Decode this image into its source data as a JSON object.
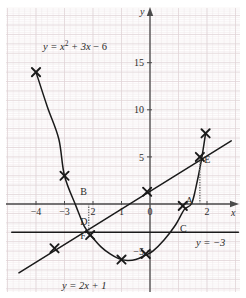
{
  "chart_data": {
    "type": "line",
    "title": "",
    "xlabel": "x",
    "ylabel": "y",
    "xlim": [
      -4.85,
      3.1
    ],
    "ylim": [
      -7.6,
      16.8
    ],
    "grid": true,
    "grid_major": 1,
    "grid_minor": 0.2,
    "x_ticks": [
      -4,
      -3,
      -2,
      -1,
      0,
      2
    ],
    "x_tick_labels": [
      "−4",
      "−3",
      "2",
      "1",
      "0",
      "2"
    ],
    "y_ticks": [
      15,
      10,
      5,
      -5
    ],
    "y_tick_labels": [
      "15",
      "10",
      "5",
      "−5"
    ],
    "series": [
      {
        "name": "parabola",
        "label": "y = x² + 3x − 6",
        "type": "curve",
        "points": [
          [
            -4.0,
            14.0
          ],
          [
            -3.6,
            10.3
          ],
          [
            -3.2,
            6.9
          ],
          [
            -3.0,
            3.0
          ],
          [
            -2.6,
            -0.2
          ],
          [
            -2.3,
            -2.4
          ],
          [
            -2.0,
            -3.6
          ],
          [
            -1.7,
            -4.6
          ],
          [
            -1.4,
            -5.3
          ],
          [
            -1.1,
            -5.8
          ],
          [
            -0.8,
            -6.0
          ],
          [
            -0.5,
            -5.9
          ],
          [
            -0.2,
            -5.5
          ],
          [
            0.1,
            -5.0
          ],
          [
            0.5,
            -3.8
          ],
          [
            0.9,
            -2.2
          ],
          [
            1.2,
            -0.6
          ],
          [
            1.45,
            0.0
          ],
          [
            1.6,
            1.6
          ],
          [
            1.8,
            4.6
          ],
          [
            1.95,
            7.5
          ]
        ],
        "markers": [
          [
            -4.0,
            14.0
          ],
          [
            -3.0,
            3.0
          ],
          [
            -2.1,
            -3.3
          ],
          [
            -1.0,
            -5.9
          ],
          [
            -0.15,
            -5.3
          ],
          [
            1.15,
            -0.2
          ],
          [
            1.95,
            7.5
          ]
        ]
      },
      {
        "name": "line",
        "label": "y = 2x + 1",
        "type": "straight",
        "points": [
          [
            -4.6,
            -7.3
          ],
          [
            2.85,
            6.7
          ]
        ],
        "markers": [
          [
            -3.35,
            -4.7
          ],
          [
            -0.1,
            1.3
          ],
          [
            1.75,
            5.0
          ]
        ]
      },
      {
        "name": "horizontal-line",
        "label": "y = −3",
        "type": "straight",
        "points": [
          [
            -4.85,
            -3.0
          ],
          [
            3.1,
            -3.0
          ]
        ],
        "markers": []
      }
    ],
    "annotations": [
      {
        "id": "A",
        "label": "A",
        "x": 1.25,
        "y": 0.0
      },
      {
        "id": "B",
        "label": "B",
        "x": -2.45,
        "y": 0.95
      },
      {
        "id": "C",
        "label": "C",
        "x": 1.05,
        "y": -3.0
      },
      {
        "id": "D",
        "label": "D",
        "x": -2.45,
        "y": -2.2
      },
      {
        "id": "E",
        "label": "E",
        "x": 1.9,
        "y": 4.3
      },
      {
        "id": "F",
        "label": "F",
        "x": -2.45,
        "y": -3.75
      }
    ],
    "dotted_guides": [
      {
        "name": "guide-D",
        "x": -2.15,
        "y_from": 0.0,
        "y_to": -3.2
      },
      {
        "name": "guide-E",
        "x": 1.75,
        "y_from": 0.0,
        "y_to": 4.8
      }
    ],
    "colors": {
      "grid_major": "#e0d3d5",
      "grid_minor": "#eee7e8",
      "curve": "#1a1a1a",
      "axis": "#4a4a4a",
      "text": "#2b2b2b"
    }
  },
  "labels": {
    "parabola_equation": "y = x² + 3x − 6",
    "line_equation": "y = 2x + 1",
    "horizontal_equation": "y = −3",
    "x_axis": "x",
    "y_axis": "y"
  }
}
